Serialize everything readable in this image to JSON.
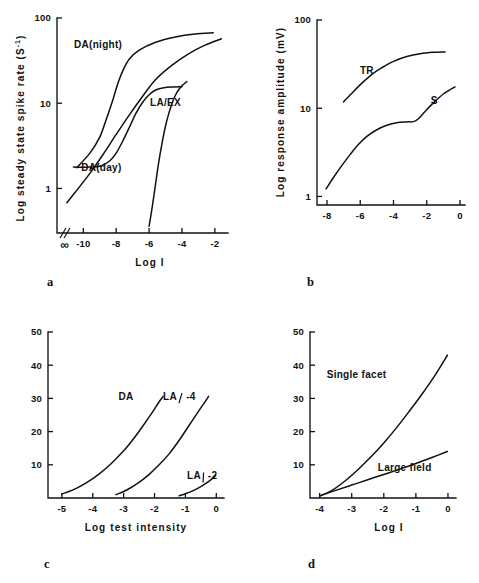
{
  "figure": {
    "background": "#ffffff",
    "ink": "#111111"
  },
  "panels": [
    {
      "letter": "a",
      "ylabel": "Log steady state spike rate (S",
      "ylabel_sup": "-1",
      "ylabel_tail": ")",
      "xlabel": "Log I",
      "yticks": [
        "1",
        "10",
        "100"
      ],
      "xticks": [
        "∞",
        "-10",
        "-8",
        "-6",
        "-4",
        "-2"
      ],
      "curve_labels": [
        "DA(night)",
        "DA(day)",
        "LA/EX"
      ]
    },
    {
      "letter": "b",
      "ylabel": "Log response amplitude (mV)",
      "xlabel": "",
      "yticks": [
        "1",
        "10",
        "100"
      ],
      "xticks": [
        "-8",
        "-6",
        "-4",
        "-2",
        "0"
      ],
      "curve_labels": [
        "TR",
        "S"
      ]
    },
    {
      "letter": "c",
      "ylabel": "",
      "xlabel": "Log test intensity",
      "yticks": [
        "10",
        "20",
        "30",
        "40",
        "50"
      ],
      "xticks": [
        "-5",
        "-4",
        "-3",
        "-2",
        "-1",
        "0"
      ],
      "curve_labels": [
        "DA",
        "LA",
        "-4",
        "LA",
        "-2"
      ]
    },
    {
      "letter": "d",
      "ylabel": "",
      "xlabel": "Log I",
      "yticks": [
        "10",
        "20",
        "30",
        "40",
        "50"
      ],
      "xticks": [
        "-4",
        "-3",
        "-2",
        "-1",
        "0"
      ],
      "curve_labels": [
        "Single facet",
        "Large field"
      ]
    }
  ],
  "chart_data": [
    {
      "type": "line",
      "panel": "a",
      "title": "",
      "xlabel": "Log I",
      "ylabel": "Log steady state spike rate (S-1)",
      "xscale": "linear-with-break",
      "yscale": "log",
      "xlim": [
        -11.6,
        -1.2
      ],
      "ylim": [
        0.3,
        100
      ],
      "xticks": [
        -10,
        -8,
        -6,
        -4,
        -2
      ],
      "xtick_labels": [
        "-10",
        "-8",
        "-6",
        "-4",
        "-2"
      ],
      "axis_break_label": "∞",
      "yticks": [
        1,
        10,
        100
      ],
      "grid": false,
      "legend": "inline-labels",
      "series": [
        {
          "name": "DA(night)",
          "label_x": -9.1,
          "label_y": 45,
          "points": [
            [
              -10.4,
              1.75
            ],
            [
              -9.6,
              2.6
            ],
            [
              -9.0,
              4.0
            ],
            [
              -8.6,
              6.5
            ],
            [
              -8.2,
              11.0
            ],
            [
              -7.9,
              17.0
            ],
            [
              -7.6,
              24.0
            ],
            [
              -7.2,
              33.0
            ],
            [
              -6.6,
              42.0
            ],
            [
              -5.6,
              52.0
            ],
            [
              -4.4,
              60.0
            ],
            [
              -3.2,
              65.0
            ],
            [
              -2.1,
              67.0
            ]
          ]
        },
        {
          "name": "DA(day)",
          "label_x": -8.9,
          "label_y": 1.62,
          "points": [
            [
              -11.0,
              0.68
            ],
            [
              -10.4,
              0.95
            ],
            [
              -9.6,
              1.5
            ],
            [
              -8.8,
              2.5
            ],
            [
              -8.0,
              4.3
            ],
            [
              -7.2,
              7.3
            ],
            [
              -6.4,
              12.0
            ],
            [
              -5.6,
              19.0
            ],
            [
              -4.6,
              28.0
            ],
            [
              -3.6,
              38.0
            ],
            [
              -2.6,
              48.0
            ],
            [
              -1.6,
              57.0
            ]
          ]
        },
        {
          "name": "DA(day)-plateau",
          "points": [
            [
              -10.6,
              1.78
            ],
            [
              -9.6,
              1.78
            ],
            [
              -8.9,
              1.85
            ],
            [
              -8.4,
              2.1
            ],
            [
              -8.0,
              2.6
            ],
            [
              -7.6,
              3.6
            ],
            [
              -7.2,
              5.2
            ],
            [
              -6.8,
              7.6
            ],
            [
              -6.4,
              10.2
            ],
            [
              -6.0,
              12.6
            ],
            [
              -5.6,
              14.3
            ],
            [
              -5.1,
              15.2
            ],
            [
              -4.5,
              15.5
            ],
            [
              -4.0,
              15.6
            ]
          ]
        },
        {
          "name": "LA/EX",
          "label_x": -5.0,
          "label_y": 9.2,
          "points": [
            [
              -6.0,
              0.36
            ],
            [
              -5.8,
              0.62
            ],
            [
              -5.6,
              1.15
            ],
            [
              -5.4,
              2.1
            ],
            [
              -5.2,
              3.5
            ],
            [
              -5.0,
              5.4
            ],
            [
              -4.8,
              7.6
            ],
            [
              -4.6,
              10.0
            ],
            [
              -4.4,
              12.4
            ],
            [
              -4.2,
              14.4
            ],
            [
              -4.0,
              16.0
            ],
            [
              -3.7,
              18.0
            ]
          ]
        }
      ]
    },
    {
      "type": "line",
      "panel": "b",
      "title": "",
      "xlabel": "",
      "ylabel": "Log response amplitude (mV)",
      "xscale": "linear",
      "yscale": "log",
      "xlim": [
        -8.6,
        0.3
      ],
      "ylim": [
        0.8,
        100
      ],
      "xticks": [
        -8,
        -6,
        -4,
        -2,
        0
      ],
      "yticks": [
        1,
        10,
        100
      ],
      "grid": false,
      "legend": "inline-labels",
      "series": [
        {
          "name": "TR",
          "label_x": -5.6,
          "label_y": 24.5,
          "points": [
            [
              -7.0,
              11.8
            ],
            [
              -6.4,
              15.5
            ],
            [
              -5.8,
              20.0
            ],
            [
              -5.2,
              25.0
            ],
            [
              -4.6,
              29.5
            ],
            [
              -4.0,
              34.0
            ],
            [
              -3.2,
              38.5
            ],
            [
              -2.4,
              41.5
            ],
            [
              -1.6,
              43.0
            ],
            [
              -0.9,
              43.5
            ]
          ]
        },
        {
          "name": "S",
          "label_x": -1.55,
          "label_y": 11.2,
          "points": [
            [
              -8.05,
              1.22
            ],
            [
              -7.6,
              1.65
            ],
            [
              -7.1,
              2.25
            ],
            [
              -6.6,
              3.0
            ],
            [
              -6.1,
              3.9
            ],
            [
              -5.6,
              4.8
            ],
            [
              -5.0,
              5.7
            ],
            [
              -4.4,
              6.4
            ],
            [
              -3.8,
              6.85
            ],
            [
              -3.2,
              7.0
            ],
            [
              -2.8,
              7.05
            ],
            [
              -2.5,
              7.6
            ],
            [
              -2.1,
              9.2
            ],
            [
              -1.6,
              11.5
            ],
            [
              -1.0,
              14.5
            ],
            [
              -0.3,
              17.5
            ]
          ]
        }
      ]
    },
    {
      "type": "line",
      "panel": "c",
      "title": "",
      "xlabel": "Log test intensity",
      "ylabel": "",
      "xscale": "linear",
      "yscale": "linear",
      "xlim": [
        -5.45,
        0.25
      ],
      "ylim": [
        0,
        50
      ],
      "xticks": [
        -5,
        -4,
        -3,
        -2,
        -1,
        0
      ],
      "yticks": [
        10,
        20,
        30,
        40,
        50
      ],
      "grid": false,
      "legend": "inline-labels",
      "series": [
        {
          "name": "DA",
          "label_x": -2.92,
          "label_y": 29.5,
          "points": [
            [
              -5.0,
              1.2
            ],
            [
              -4.6,
              2.6
            ],
            [
              -4.2,
              4.6
            ],
            [
              -3.8,
              7.2
            ],
            [
              -3.4,
              10.4
            ],
            [
              -3.0,
              14.2
            ],
            [
              -2.7,
              17.6
            ],
            [
              -2.4,
              21.4
            ],
            [
              -2.1,
              25.4
            ],
            [
              -1.85,
              29.0
            ],
            [
              -1.72,
              30.6
            ]
          ]
        },
        {
          "name": "LA -4",
          "label_x": -1.5,
          "label_y": 29.5,
          "label2_x": -0.82,
          "points": [
            [
              -3.25,
              1.0
            ],
            [
              -2.9,
              2.4
            ],
            [
              -2.55,
              4.4
            ],
            [
              -2.2,
              6.9
            ],
            [
              -1.85,
              10.0
            ],
            [
              -1.5,
              13.6
            ],
            [
              -1.2,
              17.4
            ],
            [
              -0.9,
              21.6
            ],
            [
              -0.6,
              25.8
            ],
            [
              -0.35,
              29.2
            ],
            [
              -0.25,
              30.6
            ]
          ]
        },
        {
          "name": "LA -2",
          "label_x": -0.72,
          "label_y": 5.6,
          "label2_x": -0.12,
          "points": [
            [
              -1.2,
              0.7
            ],
            [
              -1.0,
              1.3
            ],
            [
              -0.8,
              2.0
            ],
            [
              -0.6,
              2.9
            ],
            [
              -0.4,
              4.0
            ],
            [
              -0.2,
              5.3
            ],
            [
              -0.02,
              6.8
            ]
          ]
        }
      ]
    },
    {
      "type": "line",
      "panel": "d",
      "title": "",
      "xlabel": "Log I",
      "ylabel": "",
      "xscale": "linear",
      "yscale": "linear",
      "xlim": [
        -4.3,
        0.25
      ],
      "ylim": [
        0,
        50
      ],
      "xticks": [
        -4,
        -3,
        -2,
        -1,
        0
      ],
      "yticks": [
        10,
        20,
        30,
        40,
        50
      ],
      "grid": false,
      "legend": "inline-labels",
      "series": [
        {
          "name": "Single facet",
          "label_x": -2.85,
          "label_y": 36.0,
          "points": [
            [
              -4.0,
              0.6
            ],
            [
              -3.6,
              2.4
            ],
            [
              -3.2,
              5.2
            ],
            [
              -2.8,
              8.6
            ],
            [
              -2.4,
              12.4
            ],
            [
              -2.0,
              16.6
            ],
            [
              -1.6,
              21.2
            ],
            [
              -1.2,
              26.2
            ],
            [
              -0.8,
              31.4
            ],
            [
              -0.4,
              37.0
            ],
            [
              -0.02,
              43.0
            ]
          ]
        },
        {
          "name": "Large field",
          "label_x": -1.35,
          "label_y": 8.2,
          "points": [
            [
              -4.0,
              0.6
            ],
            [
              -3.5,
              2.3
            ],
            [
              -3.0,
              3.9
            ],
            [
              -2.5,
              5.5
            ],
            [
              -2.0,
              7.1
            ],
            [
              -1.5,
              8.7
            ],
            [
              -1.0,
              10.4
            ],
            [
              -0.5,
              12.2
            ],
            [
              -0.02,
              14.0
            ]
          ]
        }
      ]
    }
  ]
}
